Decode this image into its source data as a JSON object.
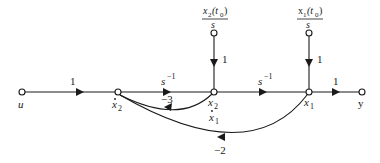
{
  "diagram": {
    "type": "signal-flow-graph",
    "nodes": {
      "u": {
        "label": "u"
      },
      "x2dot": {
        "label": "x",
        "sub": "2",
        "dot": true
      },
      "x2": {
        "label": "x",
        "sub": "2",
        "below": "x",
        "below_sub": "1",
        "below_dot": true
      },
      "x1": {
        "label": "x",
        "sub": "1"
      },
      "y": {
        "label": "y"
      },
      "ic2": {
        "num": "x",
        "num_sub": "2",
        "num_paren": "(t",
        "num_paren_sub": "0",
        "num_close": ")",
        "den": "s"
      },
      "ic1": {
        "num": "x",
        "num_sub": "1",
        "num_paren": "(t",
        "num_paren_sub": "0",
        "num_close": ")",
        "den": "s"
      }
    },
    "edges": {
      "u_to_x2dot": {
        "gain": "1"
      },
      "x2dot_to_x2": {
        "gain": "s",
        "gain_sup": "−1"
      },
      "x2_to_x1": {
        "gain": "s",
        "gain_sup": "−1"
      },
      "x1_to_y": {
        "gain": "1"
      },
      "ic2_to_x2": {
        "gain": "1"
      },
      "ic1_to_x1": {
        "gain": "1"
      },
      "x2_to_x2dot_feedback": {
        "gain": "−3"
      },
      "x1_to_x2dot_feedback": {
        "gain": "−2"
      }
    }
  }
}
